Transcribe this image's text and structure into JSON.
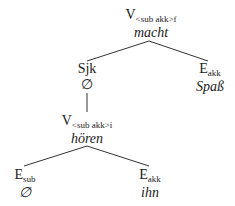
{
  "diagram": {
    "type": "dependency-tree",
    "nodes": {
      "root": {
        "category": "V",
        "subscript": "<sub akk>f",
        "word": "macht"
      },
      "sjk": {
        "category": "Sjk",
        "subscript": "",
        "word": "∅"
      },
      "eakk_top": {
        "category": "E",
        "subscript": "akk",
        "word": "Spaß"
      },
      "vinf": {
        "category": "V",
        "subscript": "<sub akk>i",
        "word": "hören"
      },
      "esub": {
        "category": "E",
        "subscript": "sub",
        "word": "∅"
      },
      "eakk_bottom": {
        "category": "E",
        "subscript": "akk",
        "word": "ihn"
      }
    },
    "edges": [
      [
        "root",
        "sjk"
      ],
      [
        "root",
        "eakk_top"
      ],
      [
        "sjk",
        "vinf"
      ],
      [
        "vinf",
        "esub"
      ],
      [
        "vinf",
        "eakk_bottom"
      ]
    ]
  }
}
